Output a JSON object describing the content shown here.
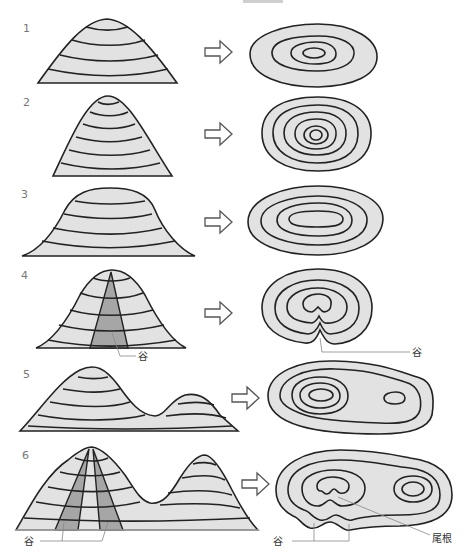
{
  "diagram": {
    "type": "topographic-contour-illustration",
    "panels": [
      {
        "number": "1",
        "profile": "symmetric conical hill",
        "map": "concentric ellipses (4 contours)"
      },
      {
        "number": "2",
        "profile": "steep narrow peak",
        "map": "tightly spaced concentric rings (6 contours)"
      },
      {
        "number": "3",
        "profile": "flat-topped broad hill",
        "map": "elongated concentric ovals (4 contours)"
      },
      {
        "number": "4",
        "profile": "hill with valley",
        "map": "contours bending inward at valley",
        "labels": {
          "left": "谷",
          "right": "谷"
        }
      },
      {
        "number": "5",
        "profile": "two peaks with saddle",
        "map": "large summit rings plus small secondary ring"
      },
      {
        "number": "6",
        "profile": "two peaks with two valleys",
        "map": "contours with valleys and ridge",
        "labels": {
          "left": "谷",
          "right_valley": "谷",
          "ridge": "尾根"
        }
      }
    ],
    "colors": {
      "fill": "#e2e2e2",
      "valley_fill": "#a6a6a6",
      "line": "#222222",
      "number": "#777777"
    }
  }
}
